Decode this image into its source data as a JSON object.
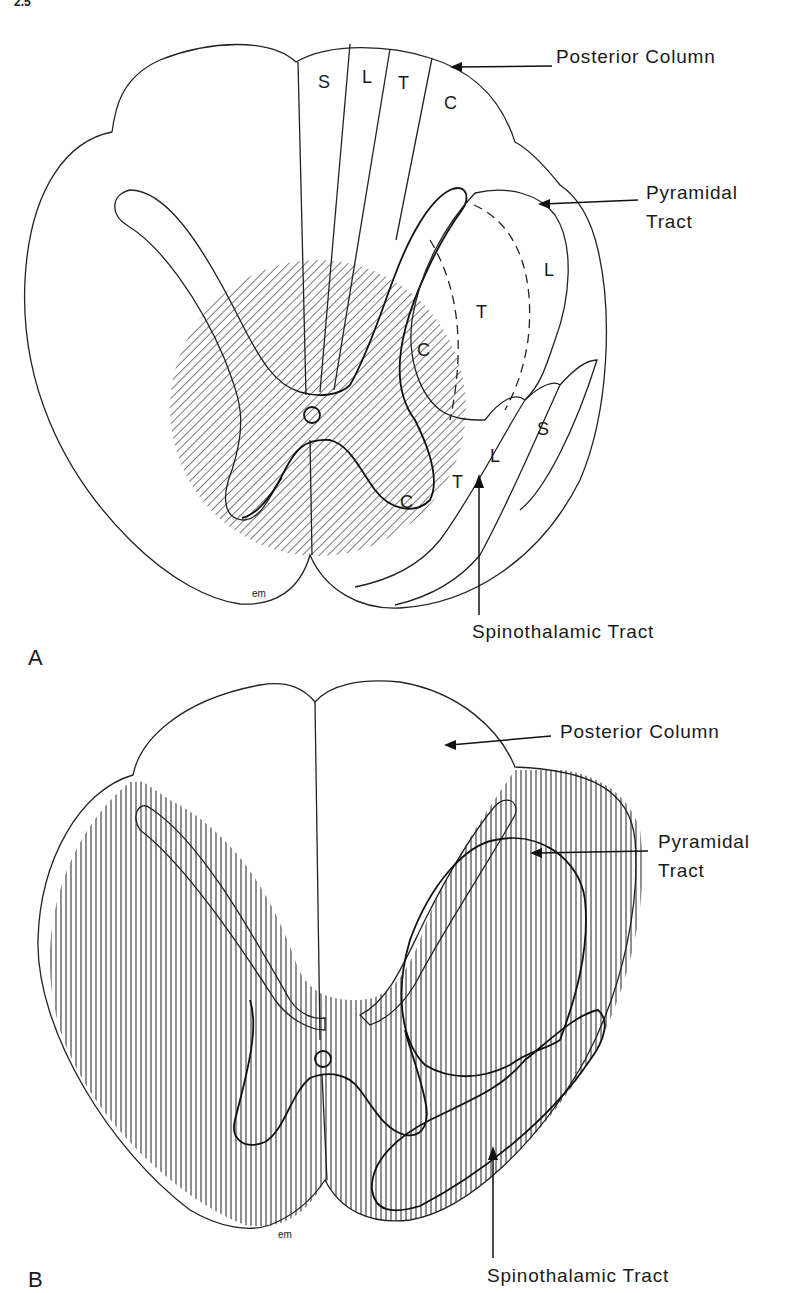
{
  "header": {
    "text": "2.5"
  },
  "panel_a": {
    "letter": "A",
    "signature": "em",
    "callouts": {
      "posterior_column": "Posterior Column",
      "pyramidal_line1": "Pyramidal",
      "pyramidal_line2": "Tract",
      "spinothalamic": "Spinothalamic Tract"
    },
    "posterior_column_segments": [
      "S",
      "L",
      "T",
      "C"
    ],
    "pyramidal_segments": [
      "C",
      "T",
      "L"
    ],
    "spinothalamic_segments": [
      "C",
      "T",
      "L",
      "S"
    ],
    "shaded_region": "central cord lesion (diagonal hatching)"
  },
  "panel_b": {
    "letter": "B",
    "signature": "em",
    "callouts": {
      "posterior_column": "Posterior Column",
      "pyramidal_line1": "Pyramidal",
      "pyramidal_line2": "Tract",
      "spinothalamic": "Spinothalamic Tract"
    },
    "shaded_region": "anterior cord lesion (vertical hatching), posterior columns spared"
  },
  "colors": {
    "ink": "#1a1a1a",
    "background": "#ffffff"
  }
}
